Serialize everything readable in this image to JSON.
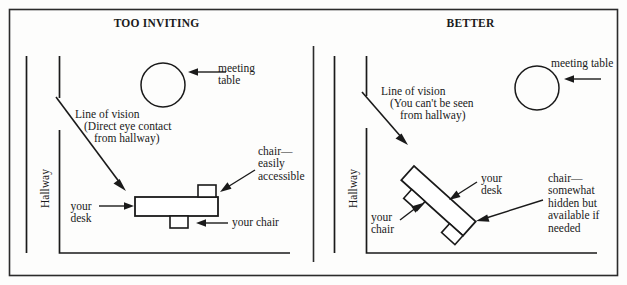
{
  "figure": {
    "type": "office-layout-diagram",
    "border_color": "#2b2b2b",
    "ink_color": "#1a1a1a",
    "background": "#fdfdfc"
  },
  "panels": [
    {
      "id": "left",
      "title": "TOO INVITING",
      "labels": {
        "meeting_table": "meeting\ntable",
        "line_of_vision_l1": "Line of vision",
        "line_of_vision_l2": "(Direct eye contact",
        "line_of_vision_l3": "from hallway)",
        "hallway": "Hallway",
        "your_desk": "your\ndesk",
        "your_chair": "your chair",
        "chair_note": "chair—\neasily\naccessible"
      }
    },
    {
      "id": "right",
      "title": "BETTER",
      "labels": {
        "meeting_table": "meeting table",
        "line_of_vision_l1": "Line of vision",
        "line_of_vision_l2": "(You can't be seen",
        "line_of_vision_l3": "from hallway)",
        "hallway": "Hallway",
        "your_desk": "your\ndesk",
        "your_chair": "your\nchair",
        "chair_note": "chair—\nsomewhat\nhidden but\navailable if\nneeded"
      }
    }
  ]
}
